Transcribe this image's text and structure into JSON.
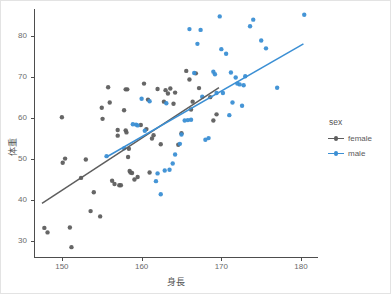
{
  "chart_data": {
    "type": "scatter",
    "title": "",
    "xlabel": "身長",
    "ylabel": "体重",
    "xlim": [
      146.5,
      182.0
    ],
    "ylim": [
      26.0,
      86.5
    ],
    "xticks": [
      "150",
      "160",
      "170",
      "180"
    ],
    "xtick_values": [
      150,
      160,
      170,
      180
    ],
    "yticks": [
      "30",
      "40",
      "50",
      "60",
      "70",
      "80"
    ],
    "ytick_values": [
      30,
      40,
      50,
      60,
      70,
      80
    ],
    "grid": false,
    "legend": {
      "title": "sex",
      "position": "right",
      "entries": [
        {
          "label": "female",
          "color": "#5e5e5e"
        },
        {
          "label": "male",
          "color": "#3b8fd4"
        }
      ]
    },
    "series": [
      {
        "name": "female",
        "color": "#5e5e5e",
        "marker": "circle",
        "points": [
          [
            147.8,
            33.1
          ],
          [
            148.2,
            32.0
          ],
          [
            150.0,
            60.1
          ],
          [
            150.1,
            49.0
          ],
          [
            150.4,
            50.0
          ],
          [
            151.0,
            33.2
          ],
          [
            151.2,
            28.4
          ],
          [
            152.4,
            45.3
          ],
          [
            153.0,
            49.8
          ],
          [
            153.6,
            37.2
          ],
          [
            154.0,
            41.8
          ],
          [
            154.8,
            35.9
          ],
          [
            155.1,
            59.7
          ],
          [
            155.0,
            62.4
          ],
          [
            155.8,
            67.4
          ],
          [
            156.0,
            63.7
          ],
          [
            156.3,
            44.6
          ],
          [
            156.6,
            43.8
          ],
          [
            157.0,
            57.0
          ],
          [
            157.0,
            55.6
          ],
          [
            157.2,
            43.5
          ],
          [
            157.4,
            43.5
          ],
          [
            157.8,
            61.8
          ],
          [
            158.0,
            66.9
          ],
          [
            158.2,
            66.9
          ],
          [
            158.0,
            56.9
          ],
          [
            158.1,
            56.4
          ],
          [
            158.3,
            50.4
          ],
          [
            158.4,
            52.4
          ],
          [
            158.5,
            47.0
          ],
          [
            158.6,
            46.6
          ],
          [
            158.8,
            46.5
          ],
          [
            159.1,
            44.9
          ],
          [
            159.5,
            45.5
          ],
          [
            160.3,
            68.3
          ],
          [
            160.6,
            57.2
          ],
          [
            161.0,
            46.6
          ],
          [
            161.3,
            54.9
          ],
          [
            161.5,
            55.7
          ],
          [
            162.0,
            67.0
          ],
          [
            162.4,
            53.5
          ],
          [
            162.8,
            63.9
          ],
          [
            163.0,
            66.7
          ],
          [
            163.3,
            65.9
          ],
          [
            164.0,
            63.4
          ],
          [
            164.2,
            66.1
          ],
          [
            164.6,
            53.4
          ],
          [
            165.0,
            56.2
          ],
          [
            165.6,
            71.4
          ],
          [
            166.0,
            69.3
          ],
          [
            166.2,
            62.0
          ],
          [
            166.4,
            63.9
          ],
          [
            166.8,
            70.8
          ],
          [
            167.2,
            67.2
          ],
          [
            168.6,
            65.0
          ],
          [
            169.0,
            59.3
          ],
          [
            169.4,
            60.8
          ],
          [
            159.9,
            58.2
          ],
          [
            163.6,
            67.1
          ],
          [
            160.8,
            64.4
          ]
        ]
      },
      {
        "name": "male",
        "color": "#3b8fd4",
        "marker": "circle",
        "points": [
          [
            155.6,
            50.6
          ],
          [
            157.8,
            52.5
          ],
          [
            159.3,
            58.3
          ],
          [
            159.5,
            58.1
          ],
          [
            160.0,
            64.6
          ],
          [
            161.0,
            64.0
          ],
          [
            161.8,
            44.5
          ],
          [
            162.4,
            41.3
          ],
          [
            162.9,
            47.1
          ],
          [
            163.5,
            47.3
          ],
          [
            163.9,
            48.8
          ],
          [
            164.2,
            51.0
          ],
          [
            165.0,
            55.9
          ],
          [
            165.4,
            59.3
          ],
          [
            165.8,
            59.4
          ],
          [
            166.0,
            81.6
          ],
          [
            166.6,
            70.9
          ],
          [
            167.0,
            78.0
          ],
          [
            167.4,
            81.4
          ],
          [
            168.0,
            54.6
          ],
          [
            168.4,
            55.0
          ],
          [
            169.0,
            71.2
          ],
          [
            169.2,
            70.6
          ],
          [
            169.4,
            66.0
          ],
          [
            169.8,
            84.7
          ],
          [
            170.0,
            76.7
          ],
          [
            170.6,
            75.6
          ],
          [
            171.0,
            60.6
          ],
          [
            171.4,
            63.7
          ],
          [
            171.8,
            69.8
          ],
          [
            172.0,
            68.3
          ],
          [
            172.3,
            68.1
          ],
          [
            172.6,
            62.9
          ],
          [
            173.0,
            70.1
          ],
          [
            173.6,
            82.3
          ],
          [
            174.0,
            83.9
          ],
          [
            175.0,
            78.8
          ],
          [
            175.6,
            76.9
          ],
          [
            177.0,
            67.3
          ],
          [
            180.4,
            85.1
          ],
          [
            158.9,
            58.4
          ],
          [
            163.1,
            63.5
          ],
          [
            160.4,
            56.8
          ],
          [
            166.2,
            59.5
          ],
          [
            167.6,
            65.1
          ],
          [
            170.2,
            66.0
          ],
          [
            171.2,
            71.0
          ],
          [
            172.8,
            67.9
          ],
          [
            164.8,
            53.6
          ],
          [
            162.0,
            46.4
          ]
        ]
      }
    ],
    "fit_lines": [
      {
        "name": "female",
        "color": "#5e5e5e",
        "x_start": 147.5,
        "y_start": 39.1,
        "x_end": 169.7,
        "y_end": 67.3
      },
      {
        "name": "male",
        "color": "#3b8fd4",
        "x_start": 155.6,
        "y_start": 50.4,
        "x_end": 180.3,
        "y_end": 78.0
      }
    ]
  }
}
